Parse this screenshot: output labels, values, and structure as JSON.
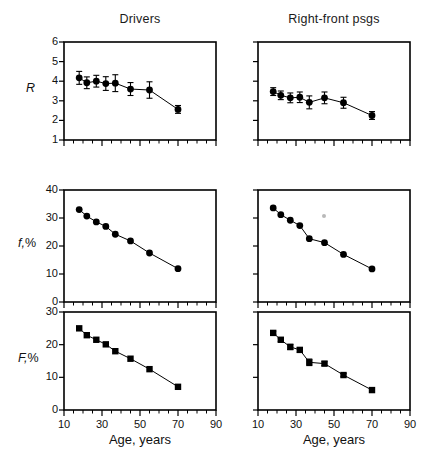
{
  "figure": {
    "column_titles": [
      "Drivers",
      "Right-front psgs"
    ],
    "x_axis_label": "Age, years"
  },
  "chart_data": [
    {
      "type": "scatter",
      "title": "Drivers",
      "panel": "row1-col1",
      "xlabel": "Age, years",
      "ylabel": "R",
      "xlim": [
        10,
        90
      ],
      "ylim": [
        1,
        6
      ],
      "xticks": [
        10,
        30,
        50,
        70,
        90
      ],
      "xticklabels": [
        "",
        "",
        "",
        "",
        ""
      ],
      "yticks": [
        1,
        2,
        3,
        4,
        5,
        6
      ],
      "yticklabels": [
        "1",
        "2",
        "3",
        "4",
        "5",
        "6"
      ],
      "grid": false,
      "marker": "circle",
      "errorbars": true,
      "x": [
        18,
        22,
        27,
        32,
        37,
        45,
        55,
        70
      ],
      "values": [
        4.17,
        3.92,
        4.0,
        3.88,
        3.9,
        3.6,
        3.55,
        2.56
      ],
      "yerr": [
        0.33,
        0.3,
        0.3,
        0.35,
        0.43,
        0.33,
        0.42,
        0.2
      ]
    },
    {
      "type": "scatter",
      "title": "Right-front psgs",
      "panel": "row1-col2",
      "xlabel": "Age, years",
      "ylabel": "R",
      "xlim": [
        10,
        90
      ],
      "ylim": [
        1,
        6
      ],
      "xticks": [
        10,
        30,
        50,
        70,
        90
      ],
      "xticklabels": [
        "",
        "",
        "",
        "",
        ""
      ],
      "yticks": [
        1,
        2,
        3,
        4,
        5,
        6
      ],
      "yticklabels": [
        "",
        "",
        "",
        "",
        "",
        ""
      ],
      "grid": false,
      "marker": "circle",
      "errorbars": true,
      "x": [
        18,
        22,
        27,
        32,
        37,
        45,
        55,
        70
      ],
      "values": [
        3.47,
        3.28,
        3.15,
        3.18,
        2.92,
        3.15,
        2.9,
        2.25
      ],
      "yerr": [
        0.2,
        0.22,
        0.25,
        0.27,
        0.33,
        0.3,
        0.28,
        0.2
      ]
    },
    {
      "type": "scatter",
      "title": "Drivers",
      "panel": "row2-col1",
      "xlabel": "Age, years",
      "ylabel": "f,%",
      "xlim": [
        10,
        90
      ],
      "ylim": [
        0,
        40
      ],
      "xticks": [
        10,
        30,
        50,
        70,
        90
      ],
      "xticklabels": [
        "",
        "",
        "",
        "",
        ""
      ],
      "yticks": [
        0,
        10,
        20,
        30,
        40
      ],
      "yticklabels": [
        "0",
        "10",
        "20",
        "30",
        "40"
      ],
      "grid": false,
      "marker": "circle",
      "errorbars": false,
      "x": [
        18,
        22,
        27,
        32,
        37,
        45,
        55,
        70
      ],
      "values": [
        33.0,
        30.7,
        28.6,
        27.0,
        24.2,
        21.8,
        17.5,
        11.9
      ]
    },
    {
      "type": "scatter",
      "title": "Right-front psgs",
      "panel": "row2-col2",
      "xlabel": "Age, years",
      "ylabel": "f,%",
      "xlim": [
        10,
        90
      ],
      "ylim": [
        0,
        40
      ],
      "xticks": [
        10,
        30,
        50,
        70,
        90
      ],
      "xticklabels": [
        "",
        "",
        "",
        "",
        ""
      ],
      "yticks": [
        0,
        10,
        20,
        30,
        40
      ],
      "yticklabels": [
        "",
        "",
        "",
        "",
        ""
      ],
      "grid": false,
      "marker": "circle",
      "errorbars": false,
      "x": [
        18,
        22,
        27,
        32,
        37,
        45,
        55,
        70
      ],
      "values": [
        33.6,
        31.2,
        29.2,
        27.3,
        22.6,
        21.2,
        17.0,
        11.8
      ]
    },
    {
      "type": "scatter",
      "title": "Drivers",
      "panel": "row3-col1",
      "xlabel": "Age, years",
      "ylabel": "F,%",
      "xlim": [
        10,
        90
      ],
      "ylim": [
        0,
        30
      ],
      "xticks": [
        10,
        30,
        50,
        70,
        90
      ],
      "xticklabels": [
        "10",
        "30",
        "50",
        "70",
        "90"
      ],
      "yticks": [
        0,
        10,
        20,
        30
      ],
      "yticklabels": [
        "0",
        "10",
        "20",
        "30"
      ],
      "grid": false,
      "marker": "square",
      "errorbars": false,
      "x": [
        18,
        22,
        27,
        32,
        37,
        45,
        55,
        70
      ],
      "values": [
        25.0,
        22.9,
        21.5,
        20.1,
        18.0,
        15.7,
        12.5,
        7.1
      ]
    },
    {
      "type": "scatter",
      "title": "Right-front psgs",
      "panel": "row3-col2",
      "xlabel": "Age, years",
      "ylabel": "F,%",
      "xlim": [
        10,
        90
      ],
      "ylim": [
        0,
        30
      ],
      "xticks": [
        10,
        30,
        50,
        70,
        90
      ],
      "xticklabels": [
        "10",
        "30",
        "50",
        "70",
        "90"
      ],
      "yticks": [
        0,
        10,
        20,
        30
      ],
      "yticklabels": [
        "",
        "",
        "",
        ""
      ],
      "grid": false,
      "marker": "square",
      "errorbars": true,
      "x": [
        18,
        22,
        27,
        32,
        37,
        45,
        55,
        70
      ],
      "values": [
        23.6,
        21.5,
        19.3,
        18.4,
        14.6,
        14.2,
        10.7,
        6.1
      ],
      "yerr": [
        0.5,
        0.5,
        0.8,
        0.7,
        1.0,
        0.6,
        0.5,
        0.4
      ]
    }
  ],
  "labels": {
    "r_symbol": "R",
    "f_symbol": "f,",
    "F_symbol": "F,",
    "percent": "%"
  }
}
